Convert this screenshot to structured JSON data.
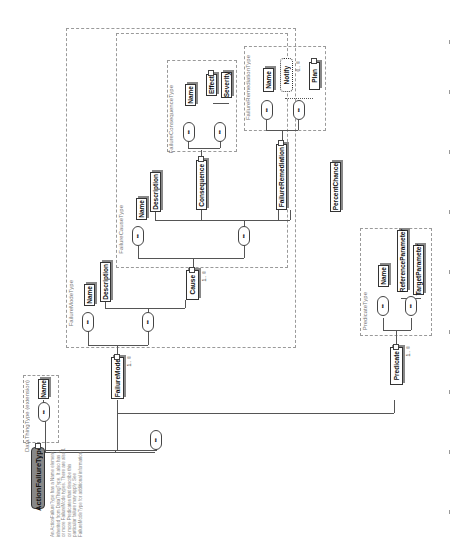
{
  "diagram": {
    "orientation": "rotated-90-ccw",
    "root": {
      "name": "ActionFailureType",
      "description": "An ActionFailureType has a Name element inherited from DataThingType. It also has 1 or more FailureMode types. There are also 1 or more Predicates that describe this particular failure may apply. See FailureModeType for additional information."
    },
    "base_type": {
      "label": "DataThingType (extension)",
      "elements": [
        "Name"
      ]
    },
    "children": [
      {
        "name": "FailureMode",
        "multiplicity": "1..∞"
      },
      {
        "name": "Predicate",
        "multiplicity": "1..∞"
      }
    ],
    "failure_mode_type": {
      "label": "FailureModeType",
      "elements": [
        "Name",
        "Description"
      ],
      "cause": {
        "name": "Cause",
        "multiplicity": "1..∞"
      }
    },
    "failure_cause_type": {
      "label": "FailureCauseType",
      "elements": [
        "Name",
        "Description",
        "Consequence",
        "FailureRemediation",
        "PercentChance"
      ]
    },
    "failure_consequence_type": {
      "label": "FailureConsequenceType",
      "elements": [
        "Name",
        "Effect",
        "Severity"
      ]
    },
    "failure_remediation_type": {
      "label": "FailureRemediationType",
      "elements": [
        "Name",
        "Notify",
        "Plan"
      ],
      "notify_multiplicity": "0..∞"
    },
    "predicate_type": {
      "label": "PredicateType",
      "elements": [
        "Name",
        "ReferenceParameter",
        "TargetParameter"
      ]
    },
    "sequence_symbol": "•••"
  }
}
